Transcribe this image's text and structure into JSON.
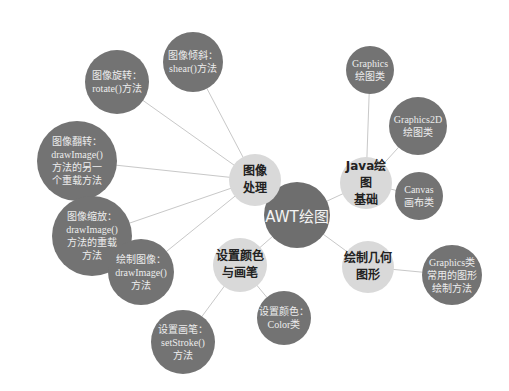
{
  "diagram": {
    "type": "mind-map",
    "colors": {
      "root": "#6e6e6e",
      "branch": "#d9d9d9",
      "leaf": "#737373",
      "edge": "#c8c8c8"
    },
    "root": {
      "id": "root",
      "label": "AWT绘图",
      "x": 297,
      "y": 215,
      "r": 33
    },
    "branches": [
      {
        "id": "img",
        "label": "图像\n处理",
        "x": 255,
        "y": 180,
        "r": 26
      },
      {
        "id": "java",
        "label": "Java绘图\n基础",
        "x": 366,
        "y": 183,
        "r": 26
      },
      {
        "id": "color",
        "label": "设置颜色\n与画笔",
        "x": 240,
        "y": 265,
        "r": 27
      },
      {
        "id": "geo",
        "label": "绘制几何\n图形",
        "x": 368,
        "y": 267,
        "r": 26
      }
    ],
    "leaves": [
      {
        "id": "shear",
        "parent": "img",
        "label": "图像倾斜：\nshear()方法",
        "x": 193,
        "y": 62,
        "r": 30
      },
      {
        "id": "rotate",
        "parent": "img",
        "label": "图像旋转：\nrotate()方法",
        "x": 117,
        "y": 82,
        "r": 32
      },
      {
        "id": "flip",
        "parent": "img",
        "label": "图像翻转：\ndrawImage()\n方法的另一\n个重载方法",
        "x": 77,
        "y": 161,
        "r": 40
      },
      {
        "id": "scale",
        "parent": "img",
        "label": "图像缩放：\ndrawImage()\n方法的重载\n方法",
        "x": 92,
        "y": 236,
        "r": 40
      },
      {
        "id": "draw",
        "parent": "img",
        "label": "绘制图像：\ndrawImage()\n方法",
        "x": 141,
        "y": 272,
        "r": 33
      },
      {
        "id": "stroke",
        "parent": "color",
        "label": "设置画笔：\nsetStroke()\n方法",
        "x": 183,
        "y": 342,
        "r": 32
      },
      {
        "id": "colorcls",
        "parent": "color",
        "label": "设置颜色：\nColor类",
        "x": 284,
        "y": 318,
        "r": 27
      },
      {
        "id": "graphics",
        "parent": "java",
        "label": "Graphics\n绘图类",
        "x": 370,
        "y": 70,
        "r": 24
      },
      {
        "id": "graphics2d",
        "parent": "java",
        "label": "Graphics2D\n绘图类",
        "x": 418,
        "y": 126,
        "r": 29
      },
      {
        "id": "canvas",
        "parent": "java",
        "label": "Canvas\n画布类",
        "x": 419,
        "y": 196,
        "r": 24
      },
      {
        "id": "methods",
        "parent": "geo",
        "label": "Graphics类\n常用的图形\n绘制方法",
        "x": 452,
        "y": 275,
        "r": 30
      }
    ]
  }
}
